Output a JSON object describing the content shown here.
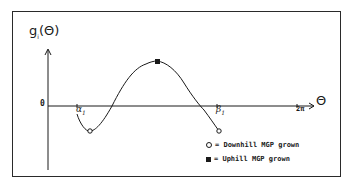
{
  "diagram": {
    "y_axis_label": "g",
    "y_axis_label_sub": "i",
    "y_axis_label_arg": "(Θ)",
    "x_axis_label": "Θ",
    "origin_label": "0",
    "alpha_label": "α",
    "alpha_sub": "1",
    "beta_label": "β",
    "beta_sub": "1",
    "end_tick_label": "2π",
    "legend": [
      {
        "symbol": "open-circle",
        "label": "= Downhill MGP grown"
      },
      {
        "symbol": "filled-square",
        "label": "= Uphill MGP grown"
      }
    ],
    "line_color": "#1a1a1a"
  }
}
